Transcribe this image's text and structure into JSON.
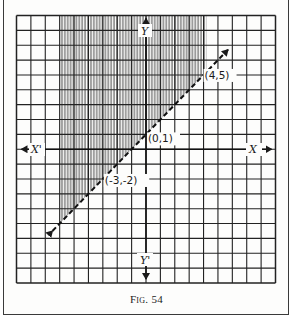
{
  "figure": {
    "caption": "Fig. 54",
    "axes": {
      "x_label": "X",
      "x_neg_label": "X'",
      "y_label": "Y",
      "y_neg_label": "Y'"
    },
    "grid": {
      "xmin": -9,
      "xmax": 9,
      "ymin": -9,
      "ymax": 9,
      "step": 1
    },
    "line": {
      "equation": "y = x + 1",
      "style": "dashed",
      "arrows": "both",
      "from": [
        -6.5,
        -5.5
      ],
      "to": [
        5.7,
        6.7
      ]
    },
    "points": [
      {
        "label": "(4,5)",
        "x": 4,
        "y": 5
      },
      {
        "label": "(0,1)",
        "x": 0,
        "y": 1
      },
      {
        "label": "(-3,-2)",
        "x": -3,
        "y": -2
      }
    ],
    "shaded_region": {
      "description": "Region above the line y = x + 1 (vertical hatching)",
      "polygon": [
        [
          -6,
          9
        ],
        [
          4.2,
          9
        ],
        [
          4.2,
          5.2
        ],
        [
          -6,
          -5
        ]
      ]
    },
    "colors": {
      "ink": "#1a1a1a",
      "paper": "#fdfdfc",
      "frame": "#3a3a3a"
    }
  }
}
